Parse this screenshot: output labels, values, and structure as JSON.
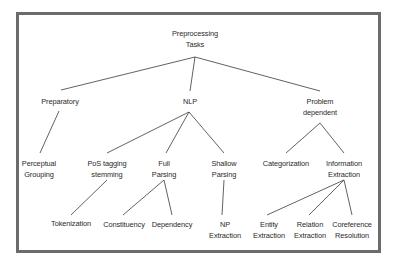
{
  "diagram": {
    "type": "tree",
    "frame_color": "#6b6b6b",
    "line_color": "#3a3a3a",
    "nodes": {
      "root": {
        "lines": [
          "Preprocessing",
          "Tasks"
        ]
      },
      "preparatory": {
        "lines": [
          "Preparatory"
        ]
      },
      "nlp": {
        "lines": [
          "NLP"
        ]
      },
      "problem_dependent": {
        "lines": [
          "Problem",
          "dependent"
        ]
      },
      "perceptual_grouping": {
        "lines": [
          "Perceptual",
          "Grouping"
        ]
      },
      "pos_tagging": {
        "lines": [
          "PoS tagging",
          "stemming"
        ]
      },
      "full_parsing": {
        "lines": [
          "Full",
          "Parsing"
        ]
      },
      "shallow_parsing": {
        "lines": [
          "Shallow",
          "Parsing"
        ]
      },
      "categorization": {
        "lines": [
          "Categorization"
        ]
      },
      "information_extraction": {
        "lines": [
          "Information",
          "Extraction"
        ]
      },
      "tokenization": {
        "lines": [
          "Tokenization"
        ]
      },
      "constituency": {
        "lines": [
          "Constituency"
        ]
      },
      "dependency": {
        "lines": [
          "Dependency"
        ]
      },
      "np_extraction": {
        "lines": [
          "NP",
          "Extraction"
        ]
      },
      "entity_extraction": {
        "lines": [
          "Entity",
          "Extraction"
        ]
      },
      "relation_extraction": {
        "lines": [
          "Relation",
          "Extraction"
        ]
      },
      "coreference_resolution": {
        "lines": [
          "Coreference",
          "Resolution"
        ]
      }
    },
    "edges": [
      [
        "root",
        "preparatory"
      ],
      [
        "root",
        "nlp"
      ],
      [
        "root",
        "problem_dependent"
      ],
      [
        "preparatory",
        "perceptual_grouping"
      ],
      [
        "nlp",
        "pos_tagging"
      ],
      [
        "nlp",
        "full_parsing"
      ],
      [
        "nlp",
        "shallow_parsing"
      ],
      [
        "problem_dependent",
        "categorization"
      ],
      [
        "problem_dependent",
        "information_extraction"
      ],
      [
        "pos_tagging",
        "tokenization"
      ],
      [
        "full_parsing",
        "constituency"
      ],
      [
        "full_parsing",
        "dependency"
      ],
      [
        "shallow_parsing",
        "np_extraction"
      ],
      [
        "information_extraction",
        "entity_extraction"
      ],
      [
        "information_extraction",
        "relation_extraction"
      ],
      [
        "information_extraction",
        "coreference_resolution"
      ]
    ]
  }
}
